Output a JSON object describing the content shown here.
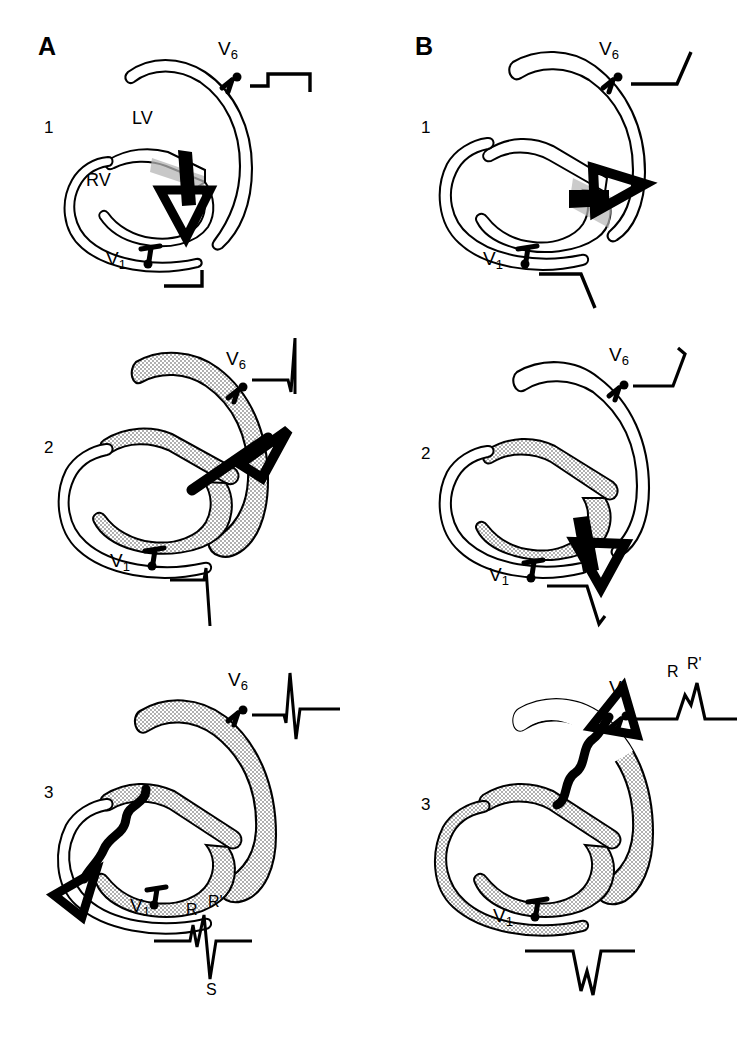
{
  "figure": {
    "type": "medical-schematic",
    "columns": [
      {
        "letter": "A",
        "name": "panel-a",
        "condition": "left-bundle-branch-block-sequence",
        "rows": [
          {
            "number": "1",
            "chamber_labels": [
              {
                "text": "LV",
                "name": "left-ventricle-label"
              },
              {
                "text": "RV",
                "name": "right-ventricle-label"
              }
            ],
            "leads": [
              {
                "name": "v6",
                "label": "V",
                "sub": "6",
                "waveform": "flat baseline with small initial positive step then return",
                "polarity": "small-initial-positive"
              },
              {
                "name": "v1",
                "label": "V",
                "sub": "1",
                "waveform": "flat baseline with small terminal upstroke",
                "polarity": "small-initial-positive"
              }
            ],
            "activation": "septal activation, left-to-right, small arrow in septum",
            "shading": "septum only"
          },
          {
            "number": "2",
            "chamber_labels": [],
            "leads": [
              {
                "name": "v6",
                "label": "V",
                "sub": "6",
                "waveform": "tall upright R wave",
                "polarity": "tall-positive"
              },
              {
                "name": "v1",
                "label": "V",
                "sub": "1",
                "waveform": "small r then deep S wave",
                "polarity": "deep-negative"
              }
            ],
            "activation": "large arrow directed to left and posteriorly through LV free wall",
            "shading": "septum and left ventricular free wall"
          },
          {
            "number": "3",
            "chamber_labels": [],
            "leads": [
              {
                "name": "v6",
                "label": "V",
                "sub": "6",
                "waveform": "sharp biphasic complex, tall R with terminal S",
                "polarity": "biphasic"
              },
              {
                "name": "v1",
                "label": "V",
                "sub": "1",
                "waveform": "rSR' complex with deep S wave",
                "polarity": "rsr-prime",
                "annotations": [
                  "R",
                  "R'",
                  "S"
                ]
              }
            ],
            "activation": "slow wavy arrow directed rightward and anteriorly out of the right ventricle",
            "shading": "left ventricle fully shaded, right ventricle unshaded"
          }
        ]
      },
      {
        "letter": "B",
        "name": "panel-b",
        "condition": "right-bundle-branch-block-sequence",
        "rows": [
          {
            "number": "1",
            "chamber_labels": [],
            "leads": [
              {
                "name": "v6",
                "label": "V",
                "sub": "6",
                "waveform": "flat baseline with terminal upstroke",
                "polarity": "upstroke"
              },
              {
                "name": "v1",
                "label": "V",
                "sub": "1",
                "waveform": "flat baseline with terminal downstroke",
                "polarity": "downstroke"
              }
            ],
            "activation": "septal activation arrow directed to the right toward left ventricle",
            "shading": "small septal patch"
          },
          {
            "number": "2",
            "chamber_labels": [],
            "leads": [
              {
                "name": "v6",
                "label": "V",
                "sub": "6",
                "waveform": "baseline then upstroke with small terminal hook",
                "polarity": "positive-upstroke"
              },
              {
                "name": "v1",
                "label": "V",
                "sub": "1",
                "waveform": "baseline then downstroke with small terminal hook",
                "polarity": "negative-downstroke"
              }
            ],
            "activation": "arrow directed downward and to the right at the apex",
            "shading": "septum and inferior wall"
          },
          {
            "number": "3",
            "chamber_labels": [],
            "leads": [
              {
                "name": "v6",
                "label": "V",
                "sub": "6",
                "waveform": "M-shaped RR' complex",
                "polarity": "m-shaped",
                "annotations": [
                  "R",
                  "R'"
                ]
              },
              {
                "name": "v1",
                "label": "V",
                "sub": "1",
                "waveform": "W-shaped QS complex with notch",
                "polarity": "w-shaped"
              }
            ],
            "activation": "slow wavy arrow directed upward and to the right toward the base",
            "shading": "left ventricle and inferior wall shaded"
          }
        ]
      }
    ],
    "legend": {
      "shaded_region_meaning": "depolarized myocardium",
      "black_arrow_meaning": "instantaneous vector of activation",
      "wavy_arrow_meaning": "slow conduction"
    },
    "colors": {
      "ink": "#000000",
      "background": "#ffffff",
      "stipple": "#9a9a9a"
    }
  }
}
